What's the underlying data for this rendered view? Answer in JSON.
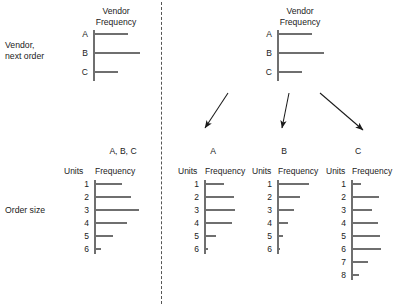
{
  "figure": {
    "row_labels": {
      "vendor": "Vendor,\nnext order",
      "order_size": "Order size"
    },
    "divider": {
      "style": "dashed-vertical"
    },
    "arrows": [
      {
        "name": "arrow-to-a",
        "from": [
          228,
          93
        ],
        "to": [
          205,
          128
        ]
      },
      {
        "name": "arrow-to-b",
        "from": [
          289,
          93
        ],
        "to": [
          282,
          128
        ]
      },
      {
        "name": "arrow-to-c",
        "from": [
          320,
          93
        ],
        "to": [
          363,
          130
        ]
      }
    ]
  },
  "charts": {
    "vendor_left": {
      "title": "Vendor\nFrequency",
      "cat_header": "",
      "freq_header": "",
      "categories": [
        "A",
        "B",
        "C"
      ],
      "values": [
        35,
        47,
        25
      ]
    },
    "vendor_right": {
      "title": "Vendor\nFrequency",
      "categories": [
        "A",
        "B",
        "C"
      ],
      "values": [
        35,
        47,
        25
      ]
    },
    "order_all": {
      "title": "A, B, C",
      "cat_header": "Units",
      "freq_header": "Frequency",
      "categories": [
        "1",
        "2",
        "3",
        "4",
        "5",
        "6"
      ],
      "values": [
        32,
        43,
        52,
        38,
        22,
        8
      ]
    },
    "order_a": {
      "title": "A",
      "cat_header": "Units",
      "freq_header": "Frequency",
      "categories": [
        "1",
        "2",
        "3",
        "4",
        "5",
        "6"
      ],
      "values": [
        23,
        34,
        36,
        32,
        14,
        5
      ]
    },
    "order_b": {
      "title": "B",
      "cat_header": "Units",
      "freq_header": "Frequency",
      "categories": [
        "1",
        "2",
        "3",
        "4",
        "5",
        "6"
      ],
      "values": [
        37,
        26,
        19,
        13,
        7,
        4
      ]
    },
    "order_c": {
      "title": "C",
      "cat_header": "Units",
      "freq_header": "Frequency",
      "categories": [
        "1",
        "2",
        "3",
        "4",
        "5",
        "6",
        "7",
        "8"
      ],
      "values": [
        11,
        32,
        24,
        31,
        33,
        34,
        20,
        9
      ]
    }
  },
  "chart_data": [
    {
      "type": "bar",
      "name": "vendor-left",
      "orientation": "horizontal",
      "title": "Vendor Frequency",
      "xlabel": "Frequency",
      "ylabel": "Vendor",
      "categories": [
        "A",
        "B",
        "C"
      ],
      "values": [
        35,
        47,
        25
      ],
      "grid": false,
      "legend": "none"
    },
    {
      "type": "bar",
      "name": "vendor-right",
      "orientation": "horizontal",
      "title": "Vendor Frequency",
      "xlabel": "Frequency",
      "ylabel": "Vendor",
      "categories": [
        "A",
        "B",
        "C"
      ],
      "values": [
        35,
        47,
        25
      ],
      "grid": false,
      "legend": "none"
    },
    {
      "type": "bar",
      "name": "order-size-all",
      "orientation": "horizontal",
      "title": "A, B, C",
      "xlabel": "Frequency",
      "ylabel": "Units",
      "categories": [
        "1",
        "2",
        "3",
        "4",
        "5",
        "6"
      ],
      "values": [
        32,
        43,
        52,
        38,
        22,
        8
      ],
      "grid": false,
      "legend": "none"
    },
    {
      "type": "bar",
      "name": "order-size-a",
      "orientation": "horizontal",
      "title": "A",
      "xlabel": "Frequency",
      "ylabel": "Units",
      "categories": [
        "1",
        "2",
        "3",
        "4",
        "5",
        "6"
      ],
      "values": [
        23,
        34,
        36,
        32,
        14,
        5
      ],
      "grid": false,
      "legend": "none"
    },
    {
      "type": "bar",
      "name": "order-size-b",
      "orientation": "horizontal",
      "title": "B",
      "xlabel": "Frequency",
      "ylabel": "Units",
      "categories": [
        "1",
        "2",
        "3",
        "4",
        "5",
        "6"
      ],
      "values": [
        37,
        26,
        19,
        13,
        7,
        4
      ],
      "grid": false,
      "legend": "none"
    },
    {
      "type": "bar",
      "name": "order-size-c",
      "orientation": "horizontal",
      "title": "C",
      "xlabel": "Frequency",
      "ylabel": "Units",
      "categories": [
        "1",
        "2",
        "3",
        "4",
        "5",
        "6",
        "7",
        "8"
      ],
      "values": [
        11,
        32,
        24,
        31,
        33,
        34,
        20,
        9
      ],
      "grid": false,
      "legend": "none"
    }
  ]
}
